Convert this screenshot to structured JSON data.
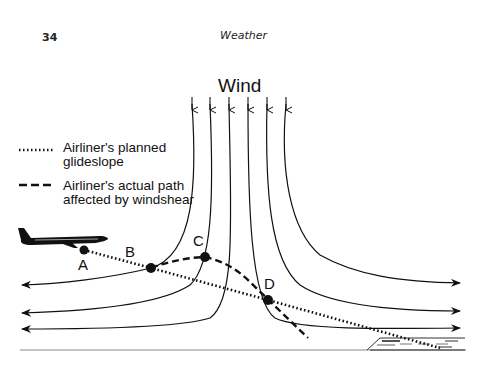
{
  "page": {
    "page_number": "34",
    "running_head": "Weather"
  },
  "figure": {
    "wind_label": "Wind",
    "legend": [
      {
        "style": "dotted",
        "line1": "Airliner's planned",
        "line2": "glideslope"
      },
      {
        "style": "dashed",
        "line1": "Airliner's actual path",
        "line2": "affected by windshear"
      }
    ],
    "points": [
      {
        "label": "A",
        "x": 84,
        "y": 250
      },
      {
        "label": "B",
        "x": 151,
        "y": 268
      },
      {
        "label": "C",
        "x": 205,
        "y": 257
      },
      {
        "label": "D",
        "x": 268,
        "y": 300
      }
    ],
    "colors": {
      "ink": "#111111",
      "ground": "#888888"
    }
  }
}
